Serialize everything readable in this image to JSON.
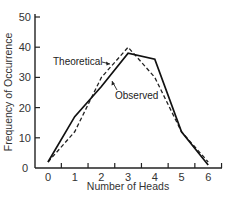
{
  "chart_data": {
    "type": "line",
    "title": "",
    "xlabel": "Number of Heads",
    "ylabel": "Frequency of Occurrence",
    "x": [
      0,
      1,
      2,
      3,
      4,
      5,
      6
    ],
    "xticks": [
      "0",
      "1",
      "2",
      "3",
      "4",
      "5",
      "6"
    ],
    "yticks": [
      "0",
      "10",
      "20",
      "30",
      "40",
      "50"
    ],
    "ylim": [
      0,
      50
    ],
    "xlim": [
      -0.5,
      6.5
    ],
    "grid": false,
    "legend": "none (inline annotations)",
    "series": [
      {
        "name": "Theoretical",
        "style": "dashed",
        "color": "#222222",
        "values": [
          2,
          12,
          30,
          40,
          30,
          12,
          2
        ]
      },
      {
        "name": "Observed",
        "style": "solid",
        "color": "#111111",
        "values": [
          2,
          17,
          27,
          38,
          36,
          12,
          1
        ]
      }
    ],
    "annotations": [
      {
        "text": "Theoretical",
        "points_to": "Theoretical",
        "near_x": 2.6
      },
      {
        "text": "Observed",
        "points_to": "Observed",
        "near_x": 2.7
      }
    ]
  }
}
